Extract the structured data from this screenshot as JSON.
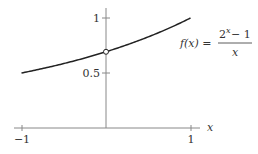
{
  "chart_data": {
    "type": "line",
    "title": "",
    "function_label": "f(x) = (2^x − 1) / x",
    "xlabel": "x",
    "ylabel": "",
    "xlim": [
      -1,
      1
    ],
    "ylim": [
      0,
      1
    ],
    "x_ticks": [
      "-1",
      "1"
    ],
    "y_ticks": [
      "0.5",
      "1"
    ],
    "series": [
      {
        "name": "f(x) = (2^x - 1)/x",
        "x": [
          -1,
          -0.75,
          -0.5,
          -0.25,
          0,
          0.25,
          0.5,
          0.75,
          1
        ],
        "values": [
          0.5,
          0.541,
          0.586,
          0.636,
          0.693,
          0.757,
          0.828,
          0.908,
          1.0
        ]
      }
    ],
    "annotations": [
      {
        "type": "open-circle",
        "x": 0,
        "y": 0.693,
        "note": "removable discontinuity at x=0"
      }
    ],
    "grid": false,
    "legend": "none"
  },
  "labels": {
    "x_axis": "x",
    "tick_neg1": "−1",
    "tick_pos1": "1",
    "ytick_1": "1",
    "ytick_05": "0.5",
    "f_lhs": "f(x) =",
    "f_num_base": "2",
    "f_num_exp": "x",
    "f_num_rest": " − 1",
    "f_den": "x"
  }
}
